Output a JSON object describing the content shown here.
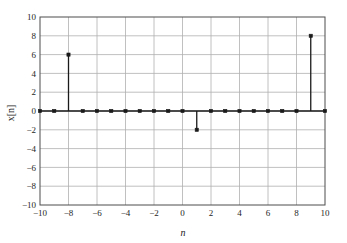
{
  "chart_data": {
    "type": "scatter",
    "plot_style": "stem",
    "title": "",
    "xlabel": "n",
    "ylabel": "x[n]",
    "xlim": [
      -10,
      10
    ],
    "ylim": [
      -10,
      10
    ],
    "xticks": [
      -10,
      -8,
      -6,
      -4,
      -2,
      0,
      2,
      4,
      6,
      8,
      10
    ],
    "xtick_labels": [
      "−10",
      "−8",
      "−6",
      "−4",
      "−2",
      "0",
      "2",
      "4",
      "6",
      "8",
      "10"
    ],
    "yticks": [
      -10,
      -8,
      -6,
      -4,
      -2,
      0,
      2,
      4,
      6,
      8,
      10
    ],
    "ytick_labels": [
      "−10",
      "−8",
      "−6",
      "−4",
      "−2",
      "0",
      "2",
      "4",
      "6",
      "8",
      "10"
    ],
    "grid": true,
    "legend": "none",
    "x": [
      -10,
      -9,
      -8,
      -7,
      -6,
      -5,
      -4,
      -3,
      -2,
      -1,
      0,
      1,
      2,
      3,
      4,
      5,
      6,
      7,
      8,
      9,
      10
    ],
    "values": [
      0,
      0,
      6,
      0,
      0,
      0,
      0,
      0,
      0,
      0,
      0,
      -2,
      0,
      0,
      0,
      0,
      0,
      0,
      0,
      8,
      0
    ],
    "nonzero_points": [
      {
        "n": -8,
        "value": 6
      },
      {
        "n": 1,
        "value": -2
      },
      {
        "n": 9,
        "value": 8
      }
    ],
    "marker": "square",
    "marker_color": "#1a1a1a",
    "stem_color": "#1a1a1a",
    "grid_color": "#b0b0b0",
    "axis_color": "#4d4d4d",
    "baseline_color": "#1a1a1a",
    "background_color": "#ffffff"
  }
}
